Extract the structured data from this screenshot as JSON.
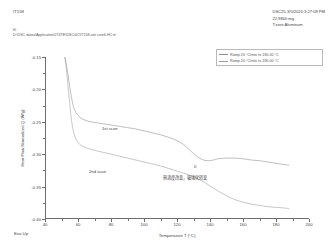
{
  "header": {
    "sample_name": "IT158",
    "file_label": "fil:",
    "file_path": "D:\\DSC datas\\Application\\274TE\\DSC\\4C\\IT158-not cure6-HC.tri",
    "instrument_line": "DSC25-3/5/2020 3:27:09 PM",
    "mass_line": "22.9800 mg",
    "pan_line": "T:zero Aluminum"
  },
  "legend": {
    "position": "top-right",
    "entries": [
      {
        "label": "Ramp 20 °C/min to 190.00 °C",
        "color": "#8b8b8b"
      },
      {
        "label": "Ramp 20 °C/min to 190.00 °C",
        "color": "#9c9c9c"
      }
    ]
  },
  "annotations": {
    "first_scan": "1st scan",
    "second_scan": "2nd scan",
    "zero_marker": "0",
    "chinese_note": "热流度改变，玻璃化转变"
  },
  "axes": {
    "exo_direction": "Exo Up",
    "x_label": "Temperature T (°C)",
    "y_label": "Heat Flow Normalized Q (W/g)"
  },
  "chart_data": {
    "type": "line",
    "title": "",
    "subtitle": "",
    "xlabel": "Temperature T (°C)",
    "ylabel": "Heat Flow Normalized Q (W/g)",
    "xlim": [
      40,
      200
    ],
    "ylim": [
      -0.4,
      -0.15
    ],
    "xticks": [
      40,
      60,
      80,
      100,
      120,
      140,
      160,
      180,
      200
    ],
    "xtick_labels": [
      "40",
      "60",
      "80",
      "100",
      "120",
      "140",
      "160",
      "180",
      "200"
    ],
    "yticks": [
      -0.15,
      -0.2,
      -0.25,
      -0.3,
      -0.35,
      -0.4
    ],
    "ytick_labels": [
      "-0.15",
      "-0.20",
      "-0.25",
      "-0.30",
      "-0.35",
      "-0.40"
    ],
    "grid": false,
    "legend_position": "upper right",
    "series": [
      {
        "name": "1st scan",
        "color": "#8a8a8a",
        "x": [
          52,
          53,
          54,
          55,
          56,
          57,
          58,
          60,
          63,
          66,
          70,
          75,
          80,
          85,
          90,
          95,
          100,
          105,
          110,
          115,
          120,
          124,
          127,
          130,
          133,
          136,
          139,
          142,
          145,
          150,
          155,
          160,
          165,
          170,
          175,
          180,
          185,
          188
        ],
        "y": [
          -0.15,
          -0.162,
          -0.178,
          -0.196,
          -0.212,
          -0.224,
          -0.232,
          -0.24,
          -0.246,
          -0.249,
          -0.251,
          -0.253,
          -0.255,
          -0.257,
          -0.259,
          -0.261,
          -0.264,
          -0.267,
          -0.27,
          -0.274,
          -0.279,
          -0.285,
          -0.292,
          -0.299,
          -0.305,
          -0.309,
          -0.31,
          -0.309,
          -0.307,
          -0.306,
          -0.306,
          -0.307,
          -0.309,
          -0.31,
          -0.312,
          -0.314,
          -0.316,
          -0.317
        ]
      },
      {
        "name": "2nd scan",
        "color": "#9a9a9a",
        "x": [
          52,
          53,
          54,
          55,
          56,
          57,
          58,
          60,
          63,
          66,
          70,
          75,
          80,
          85,
          90,
          95,
          100,
          105,
          110,
          115,
          120,
          125,
          130,
          135,
          140,
          145,
          150,
          155,
          160,
          165,
          170,
          175,
          180,
          185,
          188
        ],
        "y": [
          -0.15,
          -0.17,
          -0.196,
          -0.222,
          -0.246,
          -0.262,
          -0.272,
          -0.282,
          -0.288,
          -0.291,
          -0.294,
          -0.297,
          -0.3,
          -0.303,
          -0.306,
          -0.309,
          -0.312,
          -0.315,
          -0.318,
          -0.322,
          -0.326,
          -0.33,
          -0.335,
          -0.341,
          -0.349,
          -0.357,
          -0.364,
          -0.37,
          -0.374,
          -0.377,
          -0.379,
          -0.381,
          -0.382,
          -0.383,
          -0.384
        ]
      }
    ]
  }
}
